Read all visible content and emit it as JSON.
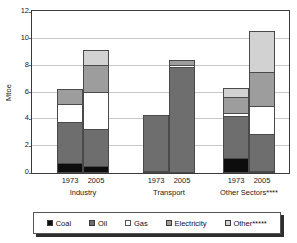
{
  "chart_data": {
    "type": "bar",
    "subtype": "stacked",
    "title": "",
    "xlabel": "",
    "ylabel": "Mtoe",
    "ylim": [
      0,
      12
    ],
    "yticks": [
      0,
      2,
      4,
      6,
      8,
      10,
      12
    ],
    "ytick_labels": [
      "0",
      "2",
      "4",
      "6",
      "8",
      "10",
      "12"
    ],
    "grid": true,
    "legend_position": "bottom",
    "groups": [
      {
        "name": "Industry",
        "label": "Industry",
        "categories": [
          "1973",
          "2005"
        ]
      },
      {
        "name": "Transport",
        "label": "Transport",
        "categories": [
          "1973",
          "2005"
        ]
      },
      {
        "name": "Other Sectors",
        "label": "Other Sectors****",
        "categories": [
          "1973",
          "2005"
        ]
      }
    ],
    "categories": [
      "Industry 1973",
      "Industry 2005",
      "Transport 1973",
      "Transport 2005",
      "Other Sectors 1973",
      "Other Sectors 2005"
    ],
    "series": [
      {
        "name": "Coal",
        "label": "Coal",
        "color": "#0d0d0d",
        "values": [
          0.7,
          0.45,
          0.1,
          0.0,
          1.1,
          0.15
        ]
      },
      {
        "name": "Oil",
        "label": "Oil",
        "color": "#6e6e6e",
        "values": [
          3.1,
          2.8,
          4.15,
          7.85,
          3.1,
          2.7
        ]
      },
      {
        "name": "Gas",
        "label": "Gas",
        "color": "#ffffff",
        "values": [
          1.3,
          2.75,
          0.0,
          0.2,
          0.25,
          2.1
        ]
      },
      {
        "name": "Electricity",
        "label": "Electricity",
        "color": "#9d9d9d",
        "values": [
          1.1,
          2.05,
          0.0,
          0.35,
          1.2,
          2.55
        ]
      },
      {
        "name": "Other",
        "label": "Other*****",
        "color": "#d2d2d2",
        "values": [
          0.0,
          1.1,
          0.0,
          0.0,
          0.65,
          3.05
        ]
      }
    ],
    "totals": [
      6.2,
      9.15,
      4.25,
      8.4,
      6.3,
      10.55
    ]
  },
  "axis": {
    "y_title": "Mtoe"
  }
}
